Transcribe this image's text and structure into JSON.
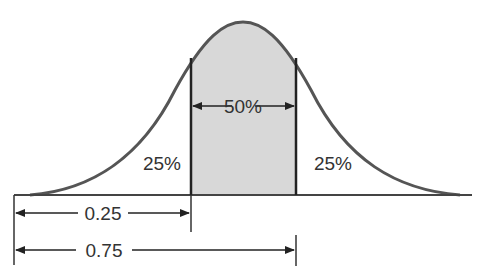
{
  "diagram": {
    "type": "normal-distribution-quartiles",
    "colors": {
      "curve": "#555555",
      "fill": "#d8d8d8",
      "lines": "#222222",
      "text": "#333333"
    },
    "regions": [
      {
        "label": "25%",
        "position": "left tail"
      },
      {
        "label": "50%",
        "position": "middle (shaded)"
      },
      {
        "label": "25%",
        "position": "right tail"
      }
    ],
    "dimensions": [
      {
        "label": "0.25",
        "from": "left edge",
        "to": "first quartile"
      },
      {
        "label": "0.75",
        "from": "left edge",
        "to": "third quartile"
      }
    ]
  }
}
